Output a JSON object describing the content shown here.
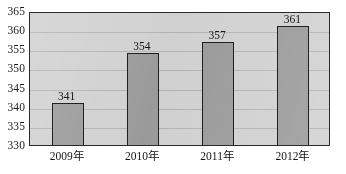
{
  "chart_data": {
    "type": "bar",
    "title": "",
    "subtitle": "",
    "xlabel": "",
    "ylabel": "",
    "categories": [
      "2009年",
      "2010年",
      "2011年",
      "2012年"
    ],
    "values": [
      341,
      354,
      357,
      361
    ],
    "value_labels": [
      "341",
      "354",
      "357",
      "361"
    ],
    "ylim": [
      330,
      365
    ],
    "ytick_values": [
      330,
      335,
      340,
      345,
      350,
      355,
      360,
      365
    ],
    "ytick_labels": [
      "330",
      "335",
      "340",
      "345",
      "350",
      "355",
      "360",
      "365"
    ],
    "grid": true,
    "grid_axis": "y",
    "legend": false,
    "legend_position": "none",
    "annotations": [],
    "colors": {
      "bar_fill": "#9d9d9d",
      "bar_edge": "#1f1f1f",
      "plot_background": "#d2d2d2",
      "gridline": "#b6b6b6",
      "frame": "#2b2b2b",
      "text": "#141414",
      "page_background": "#ffffff"
    }
  }
}
